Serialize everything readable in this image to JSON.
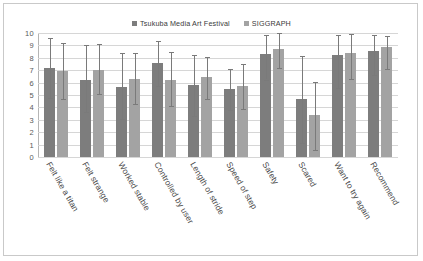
{
  "chart_data": {
    "type": "bar",
    "title": "",
    "subtitle": "",
    "xlabel": "",
    "ylabel": "",
    "ylim": [
      0,
      10
    ],
    "ytick_labels": [
      "10",
      "9",
      "8",
      "7",
      "6",
      "5",
      "4",
      "3",
      "2",
      "1",
      "0"
    ],
    "grid": true,
    "legend_position": "top-center",
    "error_bars": true,
    "categories": [
      "Felt like a titan",
      "Felt strange",
      "Worked stable",
      "Controlled by user",
      "Length of stride",
      "Speed of step",
      "Safety",
      "Scared",
      "Want to try again",
      "Recommend"
    ],
    "series": [
      {
        "name": "Tsukuba Media Art Festival",
        "color": "#7d7d7d",
        "values": [
          7.15,
          6.25,
          5.65,
          7.55,
          5.8,
          5.45,
          8.3,
          4.65,
          8.2,
          8.55
        ],
        "err_low": [
          4.75,
          3.6,
          3.05,
          5.75,
          3.3,
          3.8,
          6.25,
          1.15,
          5.6,
          6.6
        ],
        "err_high": [
          9.6,
          9.0,
          8.35,
          9.35,
          8.25,
          7.1,
          9.85,
          8.15,
          9.85,
          9.8
        ]
      },
      {
        "name": "SIGGRAPH",
        "color": "#a3a3a3",
        "values": [
          6.9,
          7.05,
          6.3,
          6.25,
          6.45,
          5.7,
          8.75,
          3.35,
          8.4,
          8.85
        ],
        "err_low": [
          4.65,
          5.05,
          4.25,
          4.1,
          4.7,
          3.85,
          7.15,
          0.6,
          6.3,
          7.1
        ],
        "err_high": [
          9.2,
          9.1,
          8.35,
          8.5,
          8.05,
          7.5,
          10.0,
          6.05,
          9.95,
          9.75
        ]
      }
    ]
  },
  "legend": {
    "entries": [
      {
        "label": "Tsukuba Media Art Festival"
      },
      {
        "label": "SIGGRAPH"
      }
    ]
  }
}
